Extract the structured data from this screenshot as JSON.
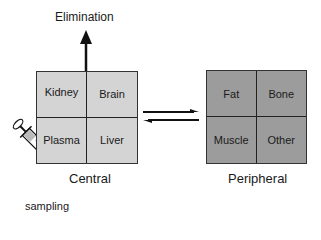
{
  "diagram": {
    "type": "two-compartment pharmacokinetic model",
    "elimination": {
      "label": "Elimination",
      "arrow_direction": "up"
    },
    "central": {
      "label": "Central",
      "fill": "#d4d4d4",
      "cells": [
        "Kidney",
        "Brain",
        "Plasma",
        "Liver"
      ]
    },
    "peripheral": {
      "label": "Peripheral",
      "fill": "#9c9c9c",
      "cells": [
        "Fat",
        "Bone",
        "Muscle",
        "Other"
      ]
    },
    "exchange": {
      "icon": "equilibrium-arrows-icon",
      "direction": "bidirectional"
    },
    "sampling": {
      "label": "sampling",
      "icon": "syringe-icon"
    }
  }
}
